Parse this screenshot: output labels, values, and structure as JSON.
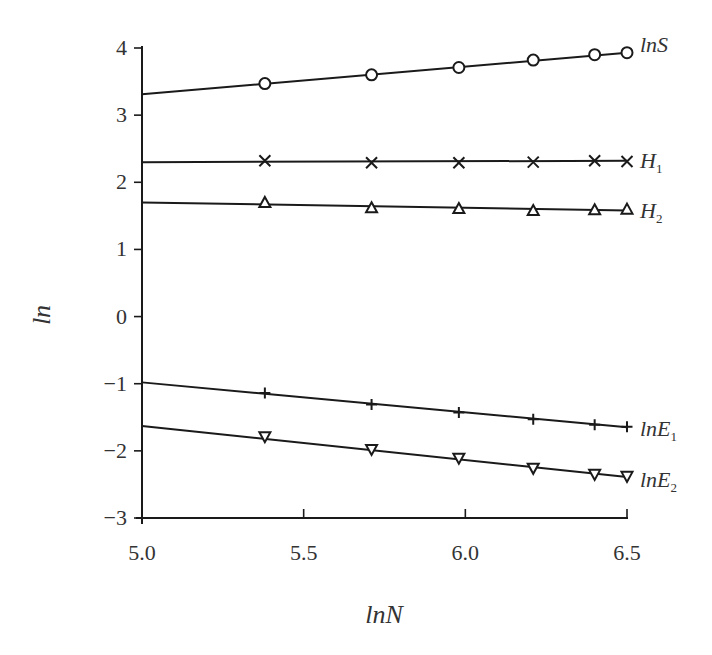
{
  "chart_data": {
    "type": "scatter",
    "title": "",
    "xlabel": "lnN",
    "ylabel": "ln",
    "xlim": [
      5.0,
      6.5
    ],
    "ylim": [
      -3,
      4
    ],
    "x_ticks": [
      "5.0",
      "5.5",
      "6.0",
      "6.5"
    ],
    "y_ticks": [
      "4",
      "3",
      "2",
      "1",
      "0",
      "−1",
      "−2",
      "−3"
    ],
    "grid": false,
    "legend": "inline labels at right end of each series",
    "x": [
      5.38,
      5.71,
      5.98,
      6.21,
      6.4,
      6.5
    ],
    "series": [
      {
        "name": "lnS",
        "label": "lnS",
        "label_sub": "",
        "marker": "circle",
        "values": [
          3.47,
          3.6,
          3.71,
          3.82,
          3.9,
          3.93
        ],
        "fit_line": {
          "x": [
            5.0,
            6.5
          ],
          "y": [
            3.31,
            3.93
          ]
        }
      },
      {
        "name": "H1",
        "label": "H",
        "label_sub": "1",
        "marker": "x",
        "values": [
          2.32,
          2.29,
          2.29,
          2.3,
          2.32,
          2.31
        ],
        "fit_line": {
          "x": [
            5.0,
            6.5
          ],
          "y": [
            2.3,
            2.32
          ]
        }
      },
      {
        "name": "H2",
        "label": "H",
        "label_sub": "2",
        "marker": "triangle-up",
        "values": [
          1.7,
          1.62,
          1.61,
          1.58,
          1.59,
          1.6
        ],
        "fit_line": {
          "x": [
            5.0,
            6.5
          ],
          "y": [
            1.7,
            1.58
          ]
        }
      },
      {
        "name": "lnE1",
        "label": "lnE",
        "label_sub": "1",
        "marker": "plus",
        "values": [
          -1.14,
          -1.31,
          -1.43,
          -1.53,
          -1.61,
          -1.64
        ],
        "fit_line": {
          "x": [
            5.0,
            6.5
          ],
          "y": [
            -0.98,
            -1.65
          ]
        }
      },
      {
        "name": "lnE2",
        "label": "lnE",
        "label_sub": "2",
        "marker": "triangle-down",
        "values": [
          -1.79,
          -1.98,
          -2.11,
          -2.26,
          -2.35,
          -2.38
        ],
        "fit_line": {
          "x": [
            5.0,
            6.5
          ],
          "y": [
            -1.63,
            -2.39
          ]
        }
      }
    ]
  },
  "style": {
    "line_color": "#1a1a1a",
    "text_color": "#333333",
    "background": "#ffffff"
  }
}
